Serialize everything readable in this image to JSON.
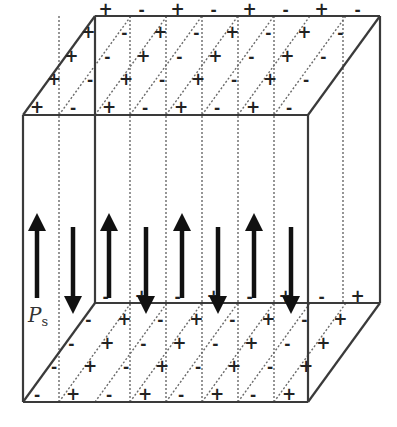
{
  "figure": {
    "label": "P",
    "label_subscript": "s",
    "colors": {
      "line": "#3a3a3a",
      "dashed": "#6a6a6a",
      "arrow": "#111111",
      "text": "#222222"
    }
  },
  "box": {
    "front": {
      "left": 23,
      "right": 308,
      "top": 115,
      "bottom": 402
    },
    "depth_offset": {
      "dx": 72,
      "dy": -99
    }
  },
  "domains": {
    "walls_x_front": [
      59,
      95,
      130,
      166,
      202,
      238,
      274
    ],
    "arrows": [
      {
        "x": 37,
        "dir": "up"
      },
      {
        "x": 73,
        "dir": "down"
      },
      {
        "x": 109,
        "dir": "up"
      },
      {
        "x": 146,
        "dir": "down"
      },
      {
        "x": 182,
        "dir": "up"
      },
      {
        "x": 218,
        "dir": "down"
      },
      {
        "x": 254,
        "dir": "up"
      },
      {
        "x": 291,
        "dir": "down"
      }
    ]
  },
  "charges": {
    "top_plus": "+",
    "top_minus": "-",
    "bottom_plus": "+",
    "bottom_minus": "-"
  }
}
